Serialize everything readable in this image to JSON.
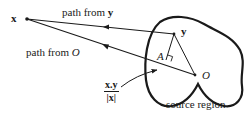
{
  "diagram": {
    "points": {
      "x": {
        "label": "x",
        "style": "bold"
      },
      "y": {
        "label": "y",
        "style": "bold"
      },
      "O": {
        "label": "O",
        "style": "italic"
      },
      "A": {
        "label": "A",
        "style": "italic"
      }
    },
    "paths": {
      "from_y": {
        "label_prefix": "path from ",
        "label_var": "y"
      },
      "from_O": {
        "label_prefix": "path from ",
        "label_var": "O"
      }
    },
    "projection": {
      "numerator": "x.y",
      "denominator": "|x|"
    },
    "region": {
      "label": "source region"
    },
    "colors": {
      "ink": "#1a1a1a",
      "background": "#ffffff"
    }
  }
}
